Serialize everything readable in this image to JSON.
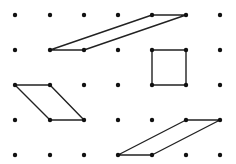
{
  "diagram": {
    "type": "dot-grid-geometry",
    "grid": {
      "cols": 7,
      "rows": 5,
      "x": [
        15,
        50,
        84,
        118,
        152,
        186,
        220
      ],
      "y": [
        15,
        50,
        85,
        120,
        155
      ],
      "dot_radius": 2.2,
      "dot_color": "#111111"
    },
    "line_color": "#222222",
    "line_width": 1.4,
    "shapes": [
      {
        "name": "parallelogram-top",
        "kind": "parallelogram",
        "points": [
          [
            4,
            0
          ],
          [
            5,
            0
          ],
          [
            2,
            1
          ],
          [
            1,
            1
          ]
        ]
      },
      {
        "name": "square",
        "kind": "square",
        "points": [
          [
            4,
            1
          ],
          [
            5,
            1
          ],
          [
            5,
            2
          ],
          [
            4,
            2
          ]
        ]
      },
      {
        "name": "parallelogram-left",
        "kind": "parallelogram",
        "points": [
          [
            0,
            2
          ],
          [
            1,
            2
          ],
          [
            2,
            3
          ],
          [
            1,
            3
          ]
        ]
      },
      {
        "name": "parallelogram-bottom",
        "kind": "parallelogram",
        "points": [
          [
            5,
            3
          ],
          [
            6,
            3
          ],
          [
            4,
            4
          ],
          [
            3,
            4
          ]
        ]
      }
    ]
  }
}
